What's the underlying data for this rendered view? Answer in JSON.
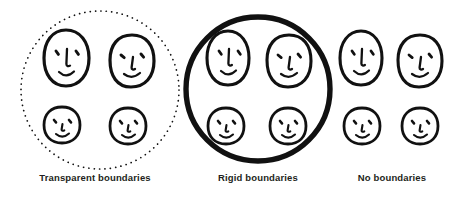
{
  "figure": {
    "background_color": "#ffffff",
    "ink_color": "#111111",
    "text_color": "#231f20"
  },
  "groups": [
    {
      "id": "transparent",
      "caption": "Transparent boundaries",
      "boundary": {
        "style": "dotted",
        "shape": "circle",
        "present": true,
        "stroke_color": "#111111",
        "stroke_width": 1.6,
        "dash": "0.1 5.2",
        "center_x": 100,
        "center_y": 90,
        "radius": 79
      },
      "faces": [
        {
          "name": "adult-face-left",
          "type": "adult",
          "cx": 66,
          "cy": 58,
          "rx": 22,
          "ry": 28,
          "expression": "smile"
        },
        {
          "name": "adult-face-right",
          "type": "adult",
          "cx": 132,
          "cy": 61,
          "rx": 22,
          "ry": 26,
          "expression": "smile"
        },
        {
          "name": "child-face-left",
          "type": "child",
          "cx": 62,
          "cy": 125,
          "rx": 18,
          "ry": 18,
          "expression": "smile"
        },
        {
          "name": "child-face-right",
          "type": "child",
          "cx": 128,
          "cy": 126,
          "rx": 18,
          "ry": 18,
          "expression": "smile"
        }
      ]
    },
    {
      "id": "rigid",
      "caption": "Rigid boundaries",
      "boundary": {
        "style": "solid",
        "shape": "circle",
        "present": true,
        "stroke_color": "#111111",
        "stroke_width": 5.2,
        "dash": "none",
        "center_x": 258,
        "center_y": 89,
        "radius": 72
      },
      "faces": [
        {
          "name": "adult-face-left",
          "type": "adult",
          "cx": 228,
          "cy": 58,
          "rx": 21,
          "ry": 27,
          "expression": "smile"
        },
        {
          "name": "adult-face-right",
          "type": "adult",
          "cx": 289,
          "cy": 61,
          "rx": 22,
          "ry": 26,
          "expression": "smile"
        },
        {
          "name": "child-face-left",
          "type": "child",
          "cx": 226,
          "cy": 126,
          "rx": 18,
          "ry": 18,
          "expression": "smile"
        },
        {
          "name": "child-face-right",
          "type": "child",
          "cx": 288,
          "cy": 126,
          "rx": 18,
          "ry": 18,
          "expression": "smile"
        }
      ]
    },
    {
      "id": "none",
      "caption": "No boundaries",
      "boundary": {
        "style": "none",
        "shape": "none",
        "present": false,
        "stroke_color": "#111111",
        "stroke_width": 0,
        "dash": "none",
        "center_x": 0,
        "center_y": 0,
        "radius": 0
      },
      "faces": [
        {
          "name": "adult-face-left",
          "type": "adult",
          "cx": 361,
          "cy": 58,
          "rx": 21,
          "ry": 27,
          "expression": "smile"
        },
        {
          "name": "adult-face-right",
          "type": "adult",
          "cx": 420,
          "cy": 61,
          "rx": 22,
          "ry": 26,
          "expression": "smile"
        },
        {
          "name": "child-face-left",
          "type": "child",
          "cx": 362,
          "cy": 126,
          "rx": 18,
          "ry": 18,
          "expression": "smile"
        },
        {
          "name": "child-face-right",
          "type": "child",
          "cx": 420,
          "cy": 126,
          "rx": 18,
          "ry": 18,
          "expression": "smile"
        }
      ]
    }
  ]
}
